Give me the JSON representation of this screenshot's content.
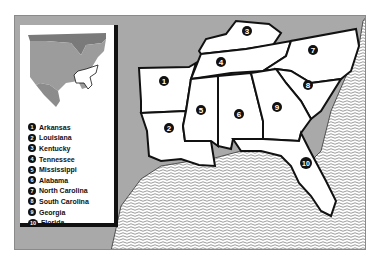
{
  "map": {
    "title": "Southeastern United States",
    "colors": {
      "land_outside": "#a9a9a9",
      "state_fill": "#ffffff",
      "border": "#111111",
      "water_pattern": "#555555",
      "inset_us": "#9c9c9c",
      "inset_canada": "#7a7a7a",
      "inset_mexico": "#8c8c8c"
    },
    "states": [
      {
        "number": "1",
        "name": "Arkansas"
      },
      {
        "number": "2",
        "name": "Louisiana"
      },
      {
        "number": "3",
        "name": "Kentucky"
      },
      {
        "number": "4",
        "name": "Tennessee"
      },
      {
        "number": "5",
        "name": "Mississippi"
      },
      {
        "number": "6",
        "name": "Alabama"
      },
      {
        "number": "7",
        "name": "North Carolina"
      },
      {
        "number": "8",
        "name": "South Carolina"
      },
      {
        "number": "9",
        "name": "Georgia"
      },
      {
        "number": "10",
        "name": "Florida"
      }
    ]
  }
}
